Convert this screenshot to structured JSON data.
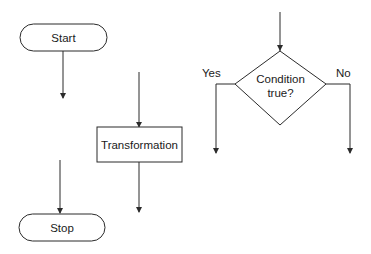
{
  "diagram": {
    "type": "flowchart-symbols",
    "colors": {
      "stroke": "#2b2b2b",
      "fill": "#ffffff",
      "text": "#1a1a1a"
    },
    "nodes": {
      "start": {
        "shape": "terminator",
        "label": "Start"
      },
      "stop": {
        "shape": "terminator",
        "label": "Stop"
      },
      "transformation": {
        "shape": "process",
        "label": "Transformation"
      },
      "condition": {
        "shape": "decision",
        "label_line1": "Condition",
        "label_line2": "true?"
      }
    },
    "branches": {
      "yes": "Yes",
      "no": "No"
    }
  }
}
